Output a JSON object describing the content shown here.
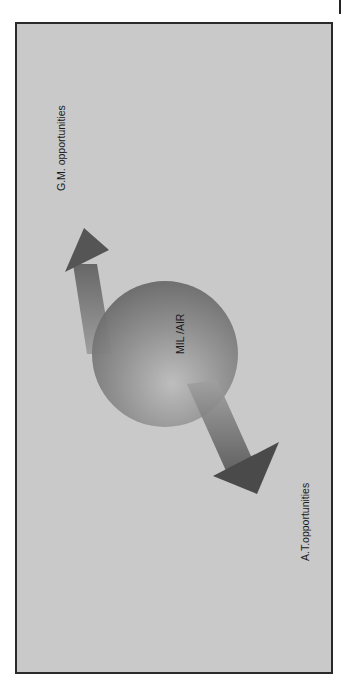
{
  "diagram": {
    "center_label": "MIL /AIR",
    "upper_label": "G.M. opportunities",
    "lower_label": "A.T.opportunities",
    "colors": {
      "background": "#c9c9c9",
      "frame_border": "#2a2a2a",
      "shape_dark": "#5a5a5a",
      "text": "#1a1a1a"
    }
  }
}
